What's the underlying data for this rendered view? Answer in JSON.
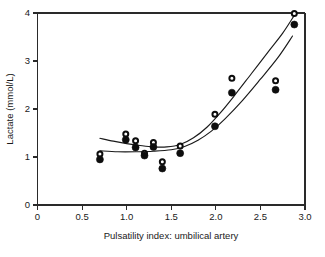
{
  "chart_data": {
    "type": "scatter",
    "title": "",
    "xlabel": "Pulsatility index: umbilical artery",
    "ylabel": "Lactate (mmol/L)",
    "xlim": [
      0,
      3.0
    ],
    "ylim": [
      0,
      4
    ],
    "grid": false,
    "legend": "none",
    "xticks": [
      0,
      0.5,
      1.0,
      1.5,
      2.0,
      2.5,
      3.0
    ],
    "xtick_labels": [
      "0",
      "0.5",
      "1.0",
      "1.5",
      "2.0",
      "2.5",
      "3.0"
    ],
    "yticks": [
      0,
      1,
      2,
      3,
      4
    ],
    "ytick_labels": [
      "0",
      "1",
      "2",
      "3",
      "4"
    ],
    "series": [
      {
        "name": "open-circle-series",
        "marker": "open-circle",
        "points": [
          {
            "x": 0.7,
            "y": 1.06
          },
          {
            "x": 0.99,
            "y": 1.48
          },
          {
            "x": 1.1,
            "y": 1.34
          },
          {
            "x": 1.2,
            "y": 1.08
          },
          {
            "x": 1.3,
            "y": 1.3
          },
          {
            "x": 1.4,
            "y": 0.9
          },
          {
            "x": 1.6,
            "y": 1.23
          },
          {
            "x": 1.99,
            "y": 1.89
          },
          {
            "x": 2.18,
            "y": 2.64
          },
          {
            "x": 2.67,
            "y": 2.59
          },
          {
            "x": 2.88,
            "y": 3.99
          }
        ]
      },
      {
        "name": "filled-circle-series",
        "marker": "filled-circle",
        "points": [
          {
            "x": 0.7,
            "y": 0.95
          },
          {
            "x": 0.99,
            "y": 1.36
          },
          {
            "x": 1.1,
            "y": 1.2
          },
          {
            "x": 1.2,
            "y": 1.03
          },
          {
            "x": 1.3,
            "y": 1.21
          },
          {
            "x": 1.4,
            "y": 0.76
          },
          {
            "x": 1.6,
            "y": 1.08
          },
          {
            "x": 1.99,
            "y": 1.64
          },
          {
            "x": 2.18,
            "y": 2.34
          },
          {
            "x": 2.67,
            "y": 2.4
          },
          {
            "x": 2.88,
            "y": 3.76
          }
        ]
      }
    ],
    "curves": [
      {
        "name": "upper-fitted-curve",
        "points": [
          {
            "x": 0.7,
            "y": 1.39
          },
          {
            "x": 0.85,
            "y": 1.33
          },
          {
            "x": 1.0,
            "y": 1.28
          },
          {
            "x": 1.15,
            "y": 1.24
          },
          {
            "x": 1.3,
            "y": 1.21
          },
          {
            "x": 1.45,
            "y": 1.21
          },
          {
            "x": 1.6,
            "y": 1.26
          },
          {
            "x": 1.75,
            "y": 1.4
          },
          {
            "x": 1.9,
            "y": 1.62
          },
          {
            "x": 2.05,
            "y": 1.92
          },
          {
            "x": 2.2,
            "y": 2.26
          },
          {
            "x": 2.4,
            "y": 2.74
          },
          {
            "x": 2.6,
            "y": 3.22
          },
          {
            "x": 2.75,
            "y": 3.58
          },
          {
            "x": 2.88,
            "y": 3.95
          }
        ]
      },
      {
        "name": "lower-fitted-curve",
        "points": [
          {
            "x": 0.7,
            "y": 1.13
          },
          {
            "x": 0.9,
            "y": 1.11
          },
          {
            "x": 1.1,
            "y": 1.11
          },
          {
            "x": 1.3,
            "y": 1.12
          },
          {
            "x": 1.5,
            "y": 1.15
          },
          {
            "x": 1.65,
            "y": 1.22
          },
          {
            "x": 1.8,
            "y": 1.35
          },
          {
            "x": 1.95,
            "y": 1.54
          },
          {
            "x": 2.1,
            "y": 1.79
          },
          {
            "x": 2.3,
            "y": 2.18
          },
          {
            "x": 2.5,
            "y": 2.62
          },
          {
            "x": 2.7,
            "y": 3.08
          },
          {
            "x": 2.86,
            "y": 3.52
          }
        ]
      }
    ]
  },
  "colors": {
    "axis": "#2a2a2a",
    "marker_fill": "#0d0d0d",
    "marker_open": "#ffffff",
    "curve": "#1a1a1a",
    "background": "#ffffff"
  }
}
